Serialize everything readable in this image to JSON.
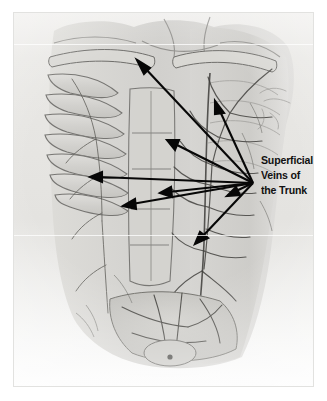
{
  "image": {
    "kind": "anatomical-illustration",
    "medium": "graphite pencil drawing",
    "subject": "dissected human trunk, anterior view",
    "palette": {
      "mat": "#ffffff",
      "paper": "#e9e8e5",
      "ink": "#3a3a38",
      "arrow": "#080808",
      "label_text": "#111111"
    }
  },
  "annotation": {
    "label_lines": [
      "Superficial",
      "Veins of",
      "the Trunk"
    ],
    "line1": "Superficial",
    "line2": "Veins of",
    "line3": "the Trunk",
    "convergence_point": {
      "x": 253,
      "y": 183
    },
    "arrow_count": 8,
    "arrow_targets": [
      {
        "name": "clavicular-region",
        "x": 137,
        "y": 62
      },
      {
        "name": "upper-right-thorax",
        "x": 215,
        "y": 103
      },
      {
        "name": "mid-thorax",
        "x": 168,
        "y": 140
      },
      {
        "name": "left-lateral-thorax",
        "x": 91,
        "y": 177
      },
      {
        "name": "epigastric-region",
        "x": 162,
        "y": 192
      },
      {
        "name": "right-lateral-flank",
        "x": 232,
        "y": 196
      },
      {
        "name": "left-upper-abdomen",
        "x": 123,
        "y": 207
      },
      {
        "name": "lower-right-abdomen",
        "x": 196,
        "y": 242
      }
    ]
  },
  "figure_regions": [
    {
      "name": "neck-and-shoulder"
    },
    {
      "name": "clavicle"
    },
    {
      "name": "rib-cage"
    },
    {
      "name": "intercostal-muscles"
    },
    {
      "name": "rectus-abdominis"
    },
    {
      "name": "superficial-vein-network"
    },
    {
      "name": "pelvis-and-inguinal-region"
    }
  ],
  "handwriting": {
    "present": true,
    "legible": false
  }
}
